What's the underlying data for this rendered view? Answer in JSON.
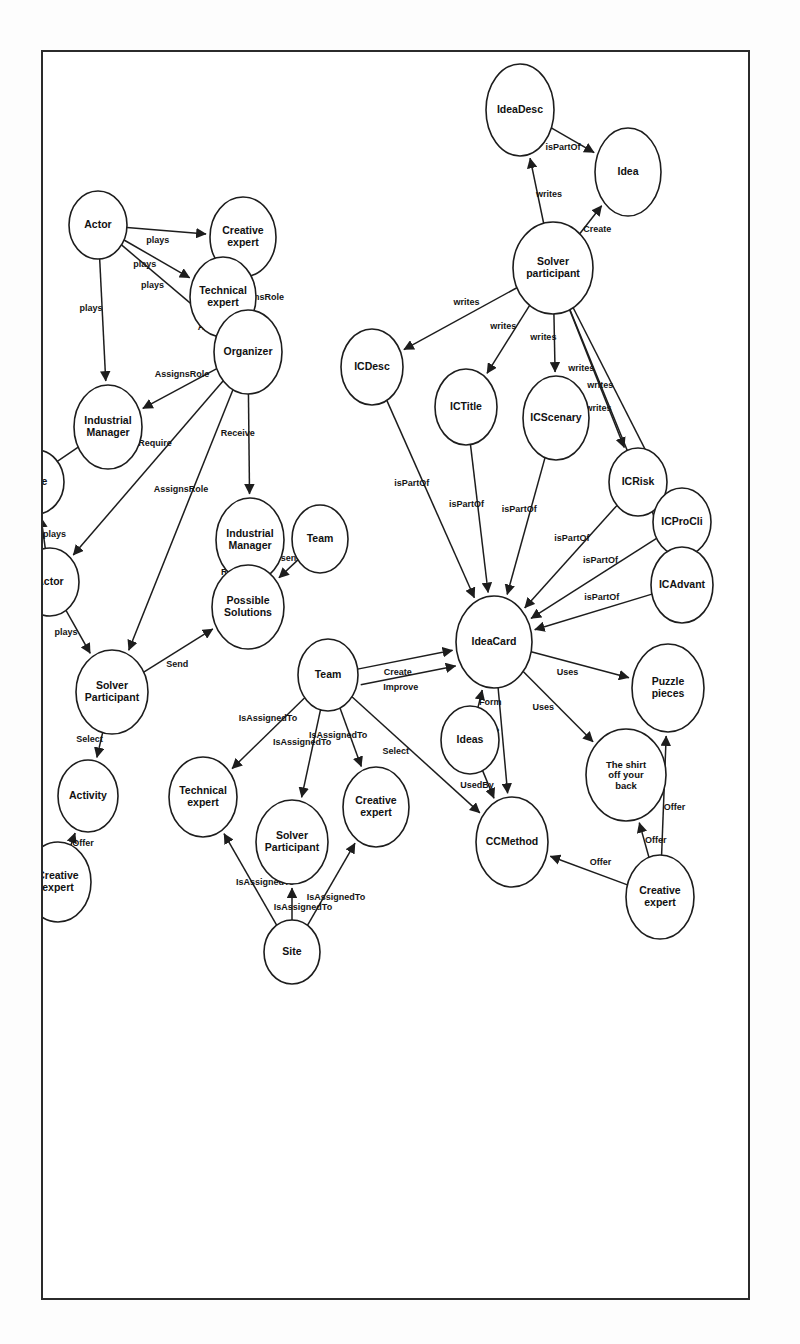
{
  "figure": {
    "type": "knowledge-graph",
    "title": "",
    "orientation": "rotated-90-clockwise",
    "frame": {
      "border_color": "#2b2b2b",
      "background": "#ffffff"
    }
  },
  "nodes": [
    {
      "id": "idea",
      "label": "Idea",
      "x": 120,
      "y": 120,
      "rx": 44,
      "ry": 33
    },
    {
      "id": "ideadesc",
      "label": "IdeaDesc",
      "x": 58,
      "y": 228,
      "rx": 46,
      "ry": 34
    },
    {
      "id": "solverpart",
      "label": "Solver\nparticipant",
      "x": 216,
      "y": 195,
      "rx": 46,
      "ry": 40
    },
    {
      "id": "icscenary",
      "label": "ICScenary",
      "x": 366,
      "y": 192,
      "rx": 42,
      "ry": 33
    },
    {
      "id": "ictitle",
      "label": "ICTitle",
      "x": 355,
      "y": 282,
      "rx": 38,
      "ry": 31
    },
    {
      "id": "icdesc",
      "label": "ICDesc",
      "x": 315,
      "y": 376,
      "rx": 38,
      "ry": 31
    },
    {
      "id": "icrisk",
      "label": "ICRisk",
      "x": 430,
      "y": 110,
      "rx": 34,
      "ry": 29
    },
    {
      "id": "icprocli",
      "label": "ICProCli",
      "x": 470,
      "y": 66,
      "rx": 34,
      "ry": 29
    },
    {
      "id": "icadvant",
      "label": "ICAdvant",
      "x": 533,
      "y": 66,
      "rx": 38,
      "ry": 31
    },
    {
      "id": "ideacard",
      "label": "IdeaCard",
      "x": 590,
      "y": 254,
      "rx": 46,
      "ry": 38
    },
    {
      "id": "puzzle",
      "label": "Puzzle\npieces",
      "x": 636,
      "y": 80,
      "rx": 44,
      "ry": 36
    },
    {
      "id": "shirt",
      "label": "The shirt\noff your\nback",
      "x": 723,
      "y": 122,
      "rx": 46,
      "ry": 40
    },
    {
      "id": "creativexp_top",
      "label": "Creative\nexpert",
      "x": 845,
      "y": 88,
      "rx": 42,
      "ry": 34
    },
    {
      "id": "ccmethod",
      "label": "CCMethod",
      "x": 790,
      "y": 236,
      "rx": 45,
      "ry": 36
    },
    {
      "id": "ideas",
      "label": "Ideas",
      "x": 688,
      "y": 278,
      "rx": 34,
      "ry": 29
    },
    {
      "id": "team_right",
      "label": "Team",
      "x": 623,
      "y": 420,
      "rx": 36,
      "ry": 30
    },
    {
      "id": "creativexp_r",
      "label": "Creative\nexpert",
      "x": 755,
      "y": 372,
      "rx": 40,
      "ry": 33
    },
    {
      "id": "solverpart_r",
      "label": "Solver\nParticipant",
      "x": 790,
      "y": 456,
      "rx": 42,
      "ry": 36
    },
    {
      "id": "technicalexp_r",
      "label": "Technical\nexpert",
      "x": 745,
      "y": 545,
      "rx": 40,
      "ry": 34
    },
    {
      "id": "site_r",
      "label": "Site",
      "x": 900,
      "y": 456,
      "rx": 32,
      "ry": 28
    },
    {
      "id": "industrialmgr_m",
      "label": "Industrial\nManager",
      "x": 488,
      "y": 498,
      "rx": 42,
      "ry": 34
    },
    {
      "id": "team_mid",
      "label": "Team",
      "x": 487,
      "y": 428,
      "rx": 34,
      "ry": 28
    },
    {
      "id": "possiblesol",
      "label": "Possible\nSolutions",
      "x": 555,
      "y": 500,
      "rx": 42,
      "ry": 36
    },
    {
      "id": "creativexp_l",
      "label": "Creative\nexpert",
      "x": 185,
      "y": 505,
      "rx": 40,
      "ry": 33
    },
    {
      "id": "technicalexp_l",
      "label": "Technical\nexpert",
      "x": 245,
      "y": 525,
      "rx": 40,
      "ry": 33
    },
    {
      "id": "organizer_m",
      "label": "Organizer",
      "x": 300,
      "y": 500,
      "rx": 42,
      "ry": 34
    },
    {
      "id": "actor_l",
      "label": "Actor",
      "x": 173,
      "y": 650,
      "rx": 34,
      "ry": 29
    },
    {
      "id": "industrialmgr_l",
      "label": "Industrial\nManager",
      "x": 375,
      "y": 640,
      "rx": 42,
      "ry": 34
    },
    {
      "id": "role",
      "label": "Role",
      "x": 430,
      "y": 712,
      "rx": 32,
      "ry": 28
    },
    {
      "id": "actor_m",
      "label": "Actor",
      "x": 530,
      "y": 698,
      "rx": 34,
      "ry": 29
    },
    {
      "id": "solverpart_m",
      "label": "Solver\nParticipant",
      "x": 640,
      "y": 636,
      "rx": 42,
      "ry": 36
    },
    {
      "id": "activity",
      "label": "Activity",
      "x": 744,
      "y": 660,
      "rx": 36,
      "ry": 30
    },
    {
      "id": "creativexp_b",
      "label": "Creative\nexpert",
      "x": 830,
      "y": 690,
      "rx": 40,
      "ry": 33
    },
    {
      "id": "technicalexp_b",
      "label": "Technical\nexpert",
      "x": 618,
      "y": 812,
      "rx": 40,
      "ry": 33
    },
    {
      "id": "team_bot",
      "label": "Team",
      "x": 720,
      "y": 872,
      "rx": 36,
      "ry": 30
    },
    {
      "id": "organizer_b",
      "label": "Organizer",
      "x": 800,
      "y": 940,
      "rx": 42,
      "ry": 34
    },
    {
      "id": "icm",
      "label": "ICM",
      "x": 572,
      "y": 930,
      "rx": 34,
      "ry": 29
    },
    {
      "id": "industry",
      "label": "Industry",
      "x": 640,
      "y": 1020,
      "rx": 36,
      "ry": 30
    },
    {
      "id": "decathlon",
      "label": "Decathlon",
      "x": 562,
      "y": 1105,
      "rx": 42,
      "ry": 34
    },
    {
      "id": "problem",
      "label": "Problem",
      "x": 690,
      "y": 1140,
      "rx": 38,
      "ry": 32
    },
    {
      "id": "insalyon",
      "label": "INSA\nLYON",
      "x": 205,
      "y": 845,
      "rx": 36,
      "ry": 33
    },
    {
      "id": "enggsi",
      "label": "ENGGSI",
      "x": 228,
      "y": 925,
      "rx": 36,
      "ry": 31
    },
    {
      "id": "site_l",
      "label": "Site",
      "x": 238,
      "y": 995,
      "rx": 32,
      "ry": 28
    },
    {
      "id": "organizer_l",
      "label": "Organizer",
      "x": 420,
      "y": 930,
      "rx": 42,
      "ry": 34
    },
    {
      "id": "event",
      "label": "Event",
      "x": 408,
      "y": 1095,
      "rx": 38,
      "ry": 32
    },
    {
      "id": "innovente",
      "label": "48h\nInnovENT-E\nedition\n2016",
      "x": 530,
      "y": 1175,
      "rx": 52,
      "ry": 44
    }
  ],
  "edges": [
    {
      "from": "solverpart",
      "to": "idea",
      "label": "Create"
    },
    {
      "from": "solverpart",
      "to": "ideadesc",
      "label": "writes"
    },
    {
      "from": "ideadesc",
      "to": "idea",
      "label": "isPartOf"
    },
    {
      "from": "solverpart",
      "to": "icadvant",
      "label": "writes"
    },
    {
      "from": "solverpart",
      "to": "icprocli",
      "label": "writes"
    },
    {
      "from": "solverpart",
      "to": "icrisk",
      "label": "writes"
    },
    {
      "from": "solverpart",
      "to": "icscenary",
      "label": "writes"
    },
    {
      "from": "solverpart",
      "to": "ictitle",
      "label": "writes"
    },
    {
      "from": "solverpart",
      "to": "icdesc",
      "label": "writes"
    },
    {
      "from": "icadvant",
      "to": "ideacard",
      "label": "isPartOf"
    },
    {
      "from": "icprocli",
      "to": "ideacard",
      "label": "isPartOf"
    },
    {
      "from": "icrisk",
      "to": "ideacard",
      "label": "isPartOf"
    },
    {
      "from": "icscenary",
      "to": "ideacard",
      "label": "isPartOf"
    },
    {
      "from": "ictitle",
      "to": "ideacard",
      "label": "isPartOf"
    },
    {
      "from": "icdesc",
      "to": "ideacard",
      "label": "isPartOf"
    },
    {
      "from": "ideacard",
      "to": "puzzle",
      "label": "Uses"
    },
    {
      "from": "ideacard",
      "to": "shirt",
      "label": "Uses"
    },
    {
      "from": "ideacard",
      "to": "ccmethod",
      "label": "Use"
    },
    {
      "from": "ideas",
      "to": "ideacard",
      "label": "Form"
    },
    {
      "from": "ideas",
      "to": "ccmethod",
      "label": "UsedBy"
    },
    {
      "from": "creativexp_top",
      "to": "puzzle",
      "label": "Offer"
    },
    {
      "from": "creativexp_top",
      "to": "shirt",
      "label": "Offer"
    },
    {
      "from": "creativexp_top",
      "to": "ccmethod",
      "label": "Offer"
    },
    {
      "from": "team_right",
      "to": "ideacard",
      "label": "Create"
    },
    {
      "from": "team_right",
      "to": "ideacard",
      "label": "Improve"
    },
    {
      "from": "team_right",
      "to": "ccmethod",
      "label": "Select"
    },
    {
      "from": "team_right",
      "to": "creativexp_r",
      "label": "IsAssignedTo"
    },
    {
      "from": "team_right",
      "to": "solverpart_r",
      "label": "IsAssignedTo"
    },
    {
      "from": "team_right",
      "to": "technicalexp_r",
      "label": "IsAssignedTo"
    },
    {
      "from": "site_r",
      "to": "creativexp_r",
      "label": "IsAssignedTo"
    },
    {
      "from": "site_r",
      "to": "solverpart_r",
      "label": "IsAssignedTo"
    },
    {
      "from": "site_r",
      "to": "technicalexp_r",
      "label": "IsAssignedTo"
    },
    {
      "from": "organizer_m",
      "to": "creativexp_l",
      "label": "AssignsRole"
    },
    {
      "from": "organizer_m",
      "to": "technicalexp_l",
      "label": "AssignsRole"
    },
    {
      "from": "organizer_m",
      "to": "industrialmgr_l",
      "label": "AssignsRole"
    },
    {
      "from": "organizer_m",
      "to": "industrialmgr_m",
      "label": "Receive"
    },
    {
      "from": "organizer_m",
      "to": "solverpart_m",
      "label": "AssignsRole"
    },
    {
      "from": "organizer_m",
      "to": "actor_m",
      "label": "Require"
    },
    {
      "from": "team_mid",
      "to": "possiblesol",
      "label": "Present"
    },
    {
      "from": "possiblesol",
      "to": "industrialmgr_m",
      "label": "Receive"
    },
    {
      "from": "solverpart_m",
      "to": "possiblesol",
      "label": "Send"
    },
    {
      "from": "actor_l",
      "to": "creativexp_l",
      "label": "plays"
    },
    {
      "from": "actor_l",
      "to": "technicalexp_l",
      "label": "plays"
    },
    {
      "from": "actor_l",
      "to": "organizer_m",
      "label": "plays"
    },
    {
      "from": "actor_l",
      "to": "industrialmgr_l",
      "label": "plays"
    },
    {
      "from": "actor_m",
      "to": "role",
      "label": "plays"
    },
    {
      "from": "actor_m",
      "to": "solverpart_m",
      "label": "plays"
    },
    {
      "from": "actor_m",
      "to": "technicalexp_b",
      "label": "plays"
    },
    {
      "from": "actor_m",
      "to": "team_bot",
      "label": "isPartOf"
    },
    {
      "from": "solverpart_m",
      "to": "activity",
      "label": "Select"
    },
    {
      "from": "creativexp_b",
      "to": "activity",
      "label": "Offer"
    },
    {
      "from": "technicalexp_b",
      "to": "team_bot",
      "label": "Helps"
    },
    {
      "from": "organizer_b",
      "to": "team_bot",
      "label": "Assign"
    },
    {
      "from": "industrialmgr_l",
      "to": "icm",
      "label": "Propose"
    },
    {
      "from": "icm",
      "to": "team_bot",
      "label": "IsAssignedTo"
    },
    {
      "from": "industry",
      "to": "team_bot",
      "label": "IsAssignedTo"
    },
    {
      "from": "decathlon",
      "to": "problem",
      "label": "has"
    },
    {
      "from": "organizer_l",
      "to": "insalyon",
      "label": "Assigns"
    },
    {
      "from": "organizer_l",
      "to": "enggsi",
      "label": "Assigns"
    },
    {
      "from": "organizer_l",
      "to": "site_l",
      "label": "Assigns"
    },
    {
      "from": "organizer_l",
      "to": "event",
      "label": "Create"
    },
    {
      "from": "organizer_l",
      "to": "innovente",
      "label": "Create"
    },
    {
      "from": "organizer_l",
      "to": "icm",
      "label": "Assign"
    },
    {
      "from": "organizer_l",
      "to": "industry",
      "label": "Assign"
    },
    {
      "from": "organizer_l",
      "to": "decathlon",
      "label": "Assign"
    },
    {
      "from": "insalyon",
      "to": "event",
      "label": "IsAssignedTo"
    }
  ],
  "edge_labels_extra": [
    {
      "label": "IsAssignedTo"
    },
    {
      "label": "AssignsRole"
    },
    {
      "label": "isPartOf"
    },
    {
      "label": "writes"
    }
  ]
}
